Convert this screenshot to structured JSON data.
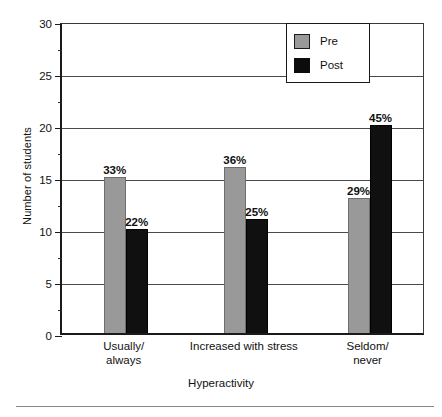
{
  "chart_data": {
    "type": "bar",
    "title": "",
    "xlabel": "Hyperactivity",
    "ylabel": "Number of students",
    "categories": [
      "Usually/\nalways",
      "Increased with stress",
      "Seldom/\nnever"
    ],
    "category_lines": [
      [
        "Usually/",
        "always"
      ],
      [
        "Increased with stress"
      ],
      [
        "Seldom/",
        "never"
      ]
    ],
    "series": [
      {
        "name": "Pre",
        "color": "#999999",
        "values": [
          15,
          16,
          13
        ],
        "point_labels": [
          "33%",
          "36%",
          "29%"
        ]
      },
      {
        "name": "Post",
        "color": "#101010",
        "values": [
          10,
          11,
          20
        ],
        "point_labels": [
          "22%",
          "25%",
          "45%"
        ]
      }
    ],
    "ylim": [
      0,
      30
    ],
    "ytick_labels": [
      "0",
      "5",
      "10",
      "15",
      "20",
      "25",
      "30"
    ],
    "ytick_values": [
      0,
      5,
      10,
      15,
      20,
      25,
      30
    ],
    "yminor_values": [
      2.5,
      7.5,
      12.5,
      17.5,
      22.5,
      27.5
    ],
    "grid": "horizontal",
    "legend_position": "top-right",
    "legend_entries": [
      "Pre",
      "Post"
    ]
  }
}
